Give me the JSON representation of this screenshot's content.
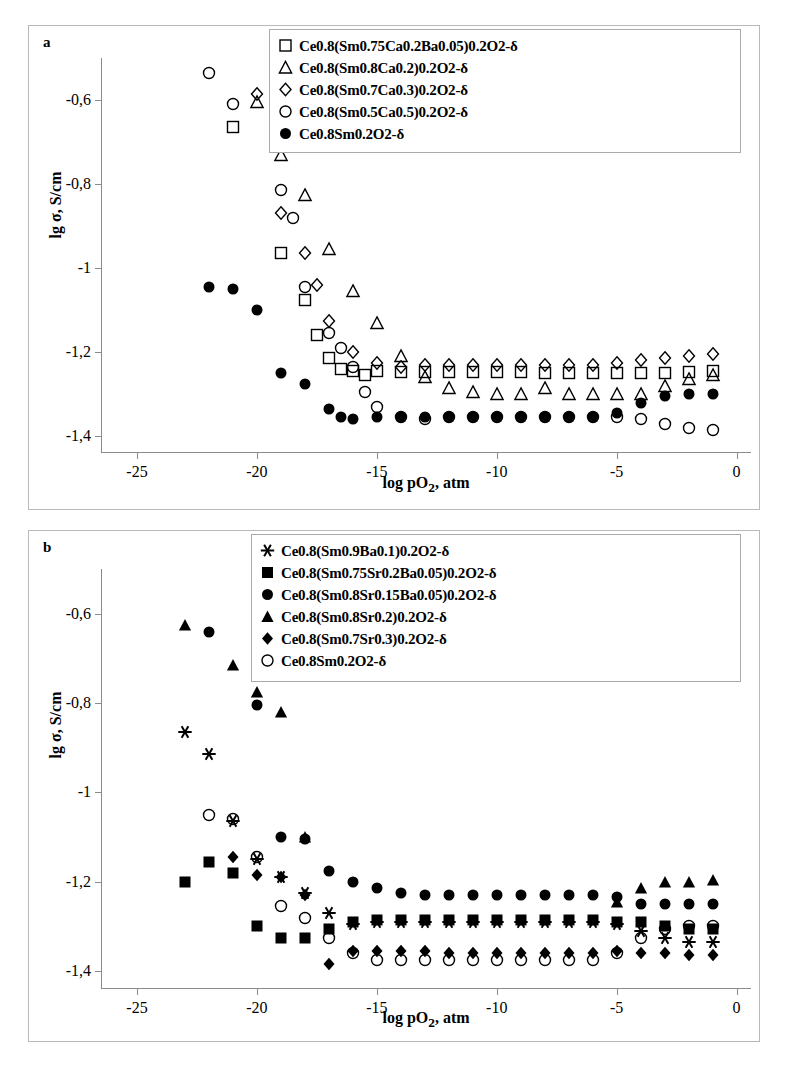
{
  "figure": {
    "panels": [
      {
        "id": "a",
        "letter": "a",
        "axis": {
          "xlabel": "log pO2, atm",
          "xlabel_html": "log pO<sub>2</sub>, atm",
          "ylabel": "lg σ, S/cm",
          "xticks": [
            -25,
            -20,
            -15,
            -10,
            -5,
            0
          ],
          "xtick_labels": [
            "-25",
            "-20",
            "-15",
            "-10",
            "-5",
            "0"
          ],
          "yticks": [
            -0.6,
            -0.8,
            -1.0,
            -1.2,
            -1.4
          ],
          "ytick_labels": [
            "-0,6",
            "-0,8",
            "-1",
            "-1,2",
            "-1,4"
          ],
          "xlim": [
            -26.5,
            0.6
          ],
          "ylim": [
            -1.44,
            -0.5
          ]
        }
      },
      {
        "id": "b",
        "letter": "b",
        "axis": {
          "xlabel": "log pO2, atm",
          "xlabel_html": "log pO<sub>2</sub>, atm",
          "ylabel": "lg σ, S/cm",
          "xticks": [
            -25,
            -20,
            -15,
            -10,
            -5,
            0
          ],
          "xtick_labels": [
            "-25",
            "-20",
            "-15",
            "-10",
            "-5",
            "0"
          ],
          "yticks": [
            -0.6,
            -0.8,
            -1.0,
            -1.2,
            -1.4
          ],
          "ytick_labels": [
            "-0,6",
            "-0,8",
            "-1",
            "-1,2",
            "-1,4"
          ],
          "xlim": [
            -26.5,
            0.6
          ],
          "ylim": [
            -1.44,
            -0.5
          ]
        }
      }
    ]
  },
  "chart_data": [
    {
      "type": "scatter",
      "panel": "a",
      "title": "",
      "xlabel": "log pO2, atm",
      "ylabel": "lg σ, S/cm",
      "xlim": [
        -26.5,
        0.6
      ],
      "ylim": [
        -1.44,
        -0.5
      ],
      "grid": false,
      "legend_position": "top-right",
      "series": [
        {
          "name": "Ce0.8(Sm0.75Ca0.2Ba0.05)0.2O2-δ",
          "marker": "open-square",
          "x": [
            -21,
            -19,
            -18,
            -17.5,
            -17,
            -16.5,
            -16,
            -15.5,
            -15,
            -14,
            -13,
            -12,
            -11,
            -10,
            -9,
            -8,
            -7,
            -6,
            -5,
            -4,
            -3,
            -2,
            -1
          ],
          "y": [
            -0.665,
            -0.965,
            -1.075,
            -1.16,
            -1.215,
            -1.24,
            -1.245,
            -1.255,
            -1.245,
            -1.248,
            -1.247,
            -1.247,
            -1.247,
            -1.247,
            -1.248,
            -1.25,
            -1.25,
            -1.25,
            -1.25,
            -1.25,
            -1.25,
            -1.248,
            -1.245
          ]
        },
        {
          "name": "Ce0.8(Sm0.8Ca0.2)0.2O2-δ",
          "marker": "open-triangle",
          "x": [
            -20,
            -19,
            -18,
            -17,
            -16,
            -15,
            -14,
            -13,
            -12,
            -11,
            -10,
            -9,
            -8,
            -7,
            -6,
            -5,
            -4,
            -3,
            -2,
            -1
          ],
          "y": [
            -0.605,
            -0.73,
            -0.825,
            -0.955,
            -1.055,
            -1.13,
            -1.21,
            -1.26,
            -1.285,
            -1.295,
            -1.3,
            -1.3,
            -1.285,
            -1.3,
            -1.3,
            -1.3,
            -1.3,
            -1.28,
            -1.265,
            -1.255
          ]
        },
        {
          "name": "Ce0.8(Sm0.7Ca0.3)0.2O2-δ",
          "marker": "open-diamond",
          "x": [
            -20,
            -19,
            -18,
            -17.5,
            -17,
            -16,
            -15,
            -14,
            -13,
            -12,
            -11,
            -10,
            -9,
            -8,
            -7,
            -6,
            -5,
            -4,
            -3,
            -2,
            -1
          ],
          "y": [
            -0.585,
            -0.87,
            -0.965,
            -1.04,
            -1.125,
            -1.2,
            -1.225,
            -1.235,
            -1.23,
            -1.23,
            -1.23,
            -1.23,
            -1.23,
            -1.23,
            -1.23,
            -1.23,
            -1.225,
            -1.218,
            -1.215,
            -1.21,
            -1.205
          ]
        },
        {
          "name": "Ce0.8(Sm0.5Ca0.5)0.2O2-δ",
          "marker": "open-circle",
          "x": [
            -22,
            -21,
            -19,
            -18.5,
            -18,
            -17,
            -16.5,
            -16,
            -15.5,
            -15,
            -14,
            -13,
            -12,
            -11,
            -10,
            -9,
            -8,
            -7,
            -6,
            -5,
            -4,
            -3,
            -2,
            -1
          ],
          "y": [
            -0.535,
            -0.61,
            -0.815,
            -0.88,
            -1.045,
            -1.155,
            -1.19,
            -1.235,
            -1.295,
            -1.33,
            -1.355,
            -1.36,
            -1.355,
            -1.355,
            -1.355,
            -1.355,
            -1.355,
            -1.355,
            -1.355,
            -1.355,
            -1.36,
            -1.37,
            -1.38,
            -1.385
          ]
        },
        {
          "name": "Ce0.8Sm0.2O2-δ",
          "marker": "filled-circle",
          "x": [
            -22,
            -21,
            -20,
            -19,
            -18,
            -17,
            -16.5,
            -16,
            -15,
            -14,
            -13,
            -12,
            -11,
            -10,
            -9,
            -8,
            -7,
            -6,
            -5,
            -4,
            -3,
            -2,
            -1
          ],
          "y": [
            -1.045,
            -1.05,
            -1.1,
            -1.25,
            -1.275,
            -1.335,
            -1.355,
            -1.36,
            -1.355,
            -1.355,
            -1.355,
            -1.355,
            -1.355,
            -1.355,
            -1.355,
            -1.355,
            -1.355,
            -1.355,
            -1.345,
            -1.32,
            -1.305,
            -1.3,
            -1.3
          ]
        }
      ]
    },
    {
      "type": "scatter",
      "panel": "b",
      "title": "",
      "xlabel": "log pO2, atm",
      "ylabel": "lg σ, S/cm",
      "xlim": [
        -26.5,
        0.6
      ],
      "ylim": [
        -1.44,
        -0.5
      ],
      "grid": false,
      "legend_position": "top-right",
      "series": [
        {
          "name": "Ce0.8(Sm0.9Ba0.1)0.2O2-δ",
          "marker": "asterisk",
          "x": [
            -23,
            -22,
            -21,
            -20,
            -19,
            -18,
            -17,
            -16,
            -15,
            -14,
            -13,
            -12,
            -11,
            -10,
            -9,
            -8,
            -7,
            -6,
            -5,
            -4,
            -3,
            -2,
            -1
          ],
          "y": [
            -0.865,
            -0.915,
            -1.065,
            -1.15,
            -1.19,
            -1.225,
            -1.27,
            -1.295,
            -1.29,
            -1.29,
            -1.29,
            -1.29,
            -1.29,
            -1.29,
            -1.29,
            -1.29,
            -1.29,
            -1.29,
            -1.295,
            -1.31,
            -1.325,
            -1.335,
            -1.335
          ]
        },
        {
          "name": "Ce0.8(Sm0.75Sr0.2Ba0.05)0.2O2-δ",
          "marker": "filled-square",
          "x": [
            -23,
            -22,
            -21,
            -20,
            -19,
            -18,
            -17,
            -16,
            -15,
            -14,
            -13,
            -12,
            -11,
            -10,
            -9,
            -8,
            -7,
            -6,
            -5,
            -4,
            -3,
            -2,
            -1
          ],
          "y": [
            -1.2,
            -1.155,
            -1.18,
            -1.3,
            -1.325,
            -1.325,
            -1.305,
            -1.29,
            -1.285,
            -1.285,
            -1.285,
            -1.285,
            -1.285,
            -1.285,
            -1.285,
            -1.285,
            -1.285,
            -1.285,
            -1.29,
            -1.29,
            -1.3,
            -1.305,
            -1.305
          ]
        },
        {
          "name": "Ce0.8(Sm0.8Sr0.15Ba0.05)0.2O2-δ",
          "marker": "filled-circle",
          "x": [
            -22,
            -20,
            -19,
            -18,
            -17,
            -16,
            -15,
            -14,
            -13,
            -12,
            -11,
            -10,
            -9,
            -8,
            -7,
            -6,
            -5,
            -4,
            -3,
            -2,
            -1
          ],
          "y": [
            -0.64,
            -0.805,
            -1.1,
            -1.105,
            -1.175,
            -1.2,
            -1.215,
            -1.225,
            -1.23,
            -1.23,
            -1.23,
            -1.23,
            -1.23,
            -1.23,
            -1.23,
            -1.23,
            -1.235,
            -1.25,
            -1.25,
            -1.25,
            -1.25
          ]
        },
        {
          "name": "Ce0.8(Sm0.8Sr0.2)0.2O2-δ",
          "marker": "filled-triangle",
          "x": [
            -23,
            -21,
            -20,
            -19,
            -18,
            -5,
            -4,
            -3,
            -2,
            -1
          ],
          "y": [
            -0.625,
            -0.715,
            -0.775,
            -0.82,
            -1.1,
            -1.245,
            -1.215,
            -1.2,
            -1.2,
            -1.195
          ]
        },
        {
          "name": "Ce0.8(Sm0.7Sr0.3)0.2O2-δ",
          "marker": "filled-diamond",
          "x": [
            -21,
            -20,
            -19,
            -18,
            -17,
            -16,
            -15,
            -14,
            -13,
            -12,
            -11,
            -10,
            -9,
            -8,
            -7,
            -6,
            -5,
            -4,
            -3,
            -2,
            -1
          ],
          "y": [
            -1.145,
            -1.185,
            -1.19,
            -1.23,
            -1.385,
            -1.355,
            -1.355,
            -1.355,
            -1.355,
            -1.36,
            -1.36,
            -1.36,
            -1.36,
            -1.36,
            -1.36,
            -1.36,
            -1.355,
            -1.36,
            -1.36,
            -1.365,
            -1.365
          ]
        },
        {
          "name": "Ce0.8Sm0.2O2-δ",
          "marker": "open-circle",
          "x": [
            -22,
            -21,
            -20,
            -19,
            -18,
            -17,
            -16,
            -15,
            -14,
            -13,
            -12,
            -11,
            -10,
            -9,
            -8,
            -7,
            -6,
            -5,
            -4,
            -3,
            -2,
            -1
          ],
          "y": [
            -1.05,
            -1.06,
            -1.145,
            -1.255,
            -1.28,
            -1.325,
            -1.36,
            -1.375,
            -1.375,
            -1.375,
            -1.375,
            -1.375,
            -1.375,
            -1.375,
            -1.375,
            -1.375,
            -1.375,
            -1.36,
            -1.325,
            -1.305,
            -1.3,
            -1.3
          ]
        }
      ]
    }
  ],
  "legends": {
    "a": {
      "items": [
        {
          "marker": "open-square",
          "label": "Ce0.8(Sm0.75Ca0.2Ba0.05)0.2O2-δ"
        },
        {
          "marker": "open-triangle",
          "label": "Ce0.8(Sm0.8Ca0.2)0.2O2-δ"
        },
        {
          "marker": "open-diamond",
          "label": "Ce0.8(Sm0.7Ca0.3)0.2O2-δ"
        },
        {
          "marker": "open-circle",
          "label": "Ce0.8(Sm0.5Ca0.5)0.2O2-δ"
        },
        {
          "marker": "filled-circle",
          "label": "Ce0.8Sm0.2O2-δ"
        }
      ]
    },
    "b": {
      "items": [
        {
          "marker": "asterisk",
          "label": "Ce0.8(Sm0.9Ba0.1)0.2O2-δ"
        },
        {
          "marker": "filled-square",
          "label": "Ce0.8(Sm0.75Sr0.2Ba0.05)0.2O2-δ"
        },
        {
          "marker": "filled-circle",
          "label": "Ce0.8(Sm0.8Sr0.15Ba0.05)0.2O2-δ"
        },
        {
          "marker": "filled-triangle",
          "label": "Ce0.8(Sm0.8Sr0.2)0.2O2-δ"
        },
        {
          "marker": "filled-diamond",
          "label": "Ce0.8(Sm0.7Sr0.3)0.2O2-δ"
        },
        {
          "marker": "open-circle",
          "label": "Ce0.8Sm0.2O2-δ"
        }
      ]
    }
  },
  "colors": {
    "ink": "#000000",
    "axis": "#8a8a8a",
    "frame": "#b9b9b9",
    "background": "#ffffff"
  }
}
